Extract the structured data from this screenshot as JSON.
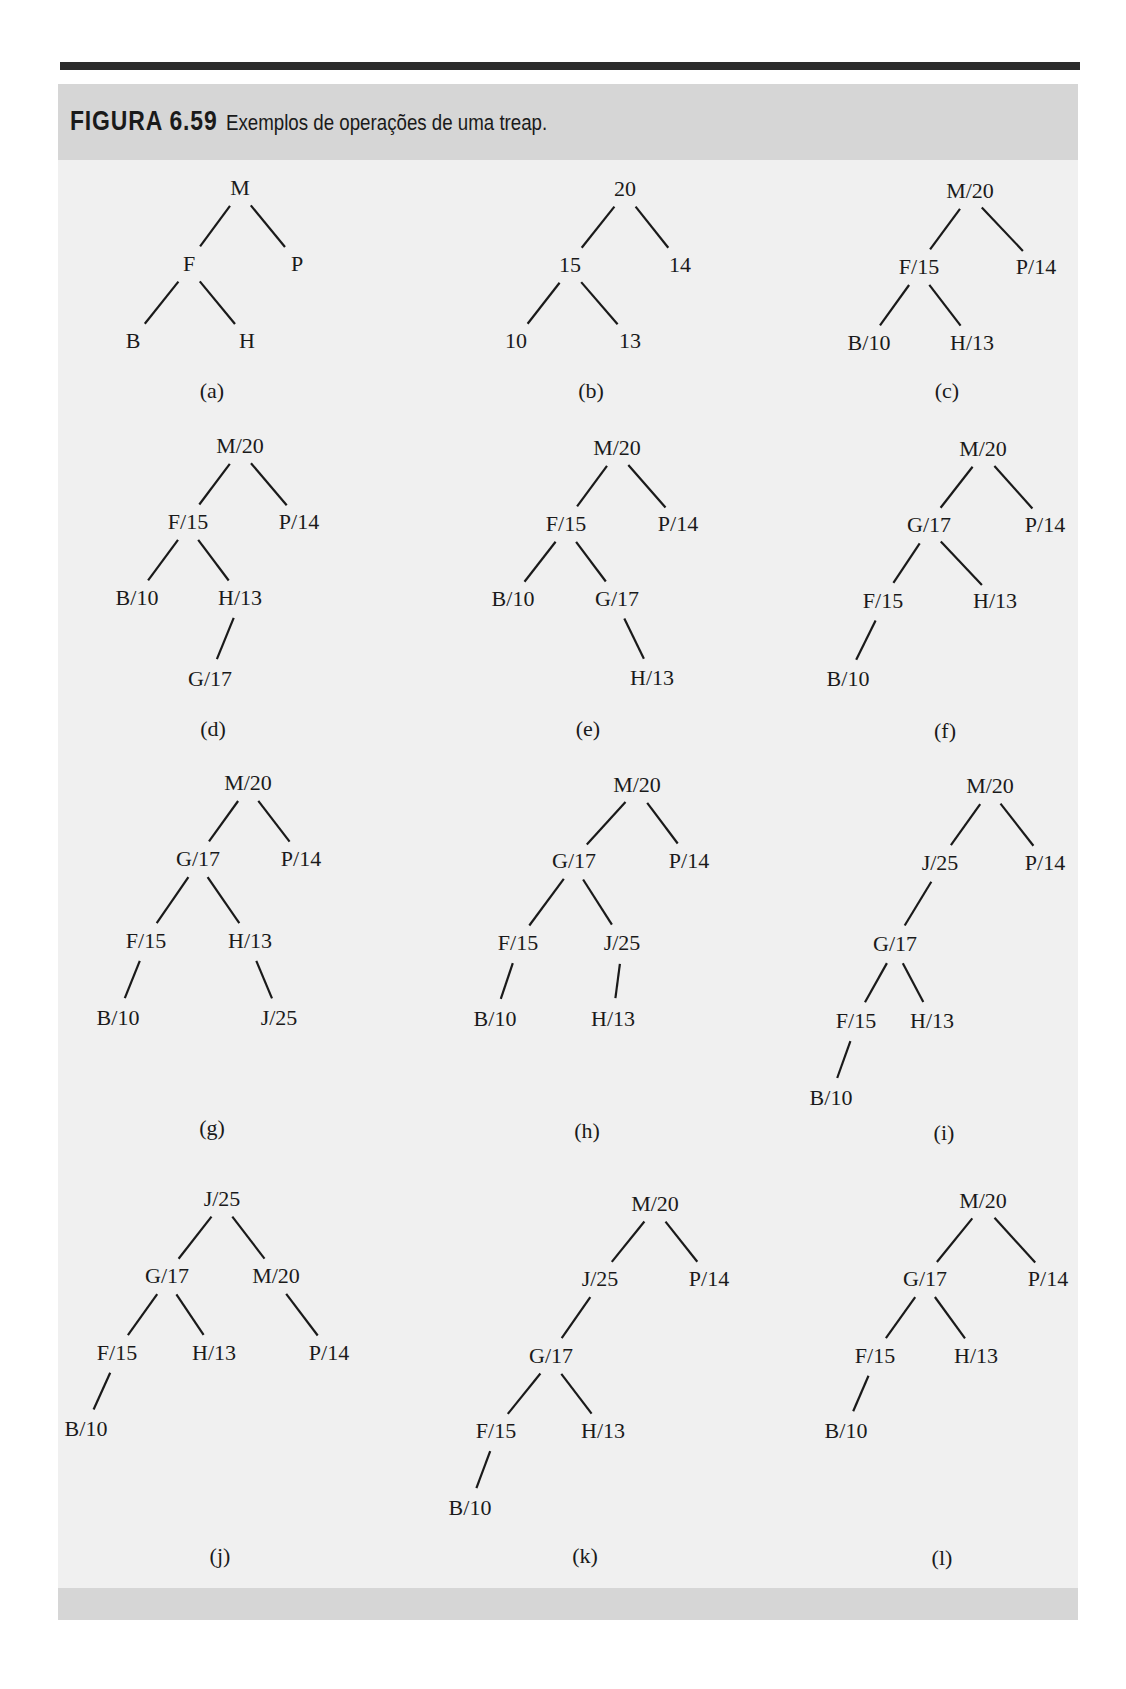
{
  "figure": {
    "number": "FIGURA 6.59",
    "caption": "Exemplos de operações de uma treap."
  },
  "trees": [
    {
      "label": "(a)",
      "label_pos": [
        212,
        390
      ],
      "nodes": [
        {
          "id": "M",
          "text": "M",
          "x": 240,
          "y": 187
        },
        {
          "id": "F",
          "text": "F",
          "x": 189,
          "y": 263
        },
        {
          "id": "P",
          "text": "P",
          "x": 297,
          "y": 263
        },
        {
          "id": "B",
          "text": "B",
          "x": 133,
          "y": 340
        },
        {
          "id": "H",
          "text": "H",
          "x": 247,
          "y": 340
        }
      ],
      "edges": [
        [
          "M",
          "F"
        ],
        [
          "M",
          "P"
        ],
        [
          "F",
          "B"
        ],
        [
          "F",
          "H"
        ]
      ]
    },
    {
      "label": "(b)",
      "label_pos": [
        591,
        390
      ],
      "nodes": [
        {
          "id": "20",
          "text": "20",
          "x": 625,
          "y": 188
        },
        {
          "id": "15",
          "text": "15",
          "x": 570,
          "y": 264
        },
        {
          "id": "14",
          "text": "14",
          "x": 680,
          "y": 264
        },
        {
          "id": "10",
          "text": "10",
          "x": 516,
          "y": 340
        },
        {
          "id": "13",
          "text": "13",
          "x": 630,
          "y": 340
        }
      ],
      "edges": [
        [
          "20",
          "15"
        ],
        [
          "20",
          "14"
        ],
        [
          "15",
          "10"
        ],
        [
          "15",
          "13"
        ]
      ]
    },
    {
      "label": "(c)",
      "label_pos": [
        947,
        390
      ],
      "nodes": [
        {
          "id": "M",
          "text": "M/20",
          "x": 970,
          "y": 190
        },
        {
          "id": "F",
          "text": "F/15",
          "x": 919,
          "y": 266
        },
        {
          "id": "P",
          "text": "P/14",
          "x": 1036,
          "y": 266
        },
        {
          "id": "B",
          "text": "B/10",
          "x": 869,
          "y": 342
        },
        {
          "id": "H",
          "text": "H/13",
          "x": 972,
          "y": 342
        }
      ],
      "edges": [
        [
          "M",
          "F"
        ],
        [
          "M",
          "P"
        ],
        [
          "F",
          "B"
        ],
        [
          "F",
          "H"
        ]
      ]
    },
    {
      "label": "(d)",
      "label_pos": [
        213,
        728
      ],
      "nodes": [
        {
          "id": "M",
          "text": "M/20",
          "x": 240,
          "y": 445
        },
        {
          "id": "F",
          "text": "F/15",
          "x": 188,
          "y": 521
        },
        {
          "id": "P",
          "text": "P/14",
          "x": 299,
          "y": 521
        },
        {
          "id": "B",
          "text": "B/10",
          "x": 137,
          "y": 597
        },
        {
          "id": "H",
          "text": "H/13",
          "x": 240,
          "y": 597
        },
        {
          "id": "G",
          "text": "G/17",
          "x": 210,
          "y": 678
        }
      ],
      "edges": [
        [
          "M",
          "F"
        ],
        [
          "M",
          "P"
        ],
        [
          "F",
          "B"
        ],
        [
          "F",
          "H"
        ],
        [
          "H",
          "G"
        ]
      ]
    },
    {
      "label": "(e)",
      "label_pos": [
        588,
        728
      ],
      "nodes": [
        {
          "id": "M",
          "text": "M/20",
          "x": 617,
          "y": 447
        },
        {
          "id": "F",
          "text": "F/15",
          "x": 566,
          "y": 523
        },
        {
          "id": "P",
          "text": "P/14",
          "x": 678,
          "y": 523
        },
        {
          "id": "B",
          "text": "B/10",
          "x": 513,
          "y": 598
        },
        {
          "id": "G",
          "text": "G/17",
          "x": 617,
          "y": 598
        },
        {
          "id": "H",
          "text": "H/13",
          "x": 652,
          "y": 677
        }
      ],
      "edges": [
        [
          "M",
          "F"
        ],
        [
          "M",
          "P"
        ],
        [
          "F",
          "B"
        ],
        [
          "F",
          "G"
        ],
        [
          "G",
          "H"
        ]
      ]
    },
    {
      "label": "(f)",
      "label_pos": [
        945,
        730
      ],
      "nodes": [
        {
          "id": "M",
          "text": "M/20",
          "x": 983,
          "y": 448
        },
        {
          "id": "G",
          "text": "G/17",
          "x": 929,
          "y": 524
        },
        {
          "id": "P",
          "text": "P/14",
          "x": 1045,
          "y": 524
        },
        {
          "id": "F",
          "text": "F/15",
          "x": 883,
          "y": 600
        },
        {
          "id": "H",
          "text": "H/13",
          "x": 995,
          "y": 600
        },
        {
          "id": "B",
          "text": "B/10",
          "x": 848,
          "y": 678
        }
      ],
      "edges": [
        [
          "M",
          "G"
        ],
        [
          "M",
          "P"
        ],
        [
          "G",
          "F"
        ],
        [
          "G",
          "H"
        ],
        [
          "F",
          "B"
        ]
      ]
    },
    {
      "label": "(g)",
      "label_pos": [
        212,
        1127
      ],
      "nodes": [
        {
          "id": "M",
          "text": "M/20",
          "x": 248,
          "y": 782
        },
        {
          "id": "G",
          "text": "G/17",
          "x": 198,
          "y": 858
        },
        {
          "id": "P",
          "text": "P/14",
          "x": 301,
          "y": 858
        },
        {
          "id": "F",
          "text": "F/15",
          "x": 146,
          "y": 940
        },
        {
          "id": "H",
          "text": "H/13",
          "x": 250,
          "y": 940
        },
        {
          "id": "B",
          "text": "B/10",
          "x": 118,
          "y": 1017
        },
        {
          "id": "J",
          "text": "J/25",
          "x": 279,
          "y": 1017
        }
      ],
      "edges": [
        [
          "M",
          "G"
        ],
        [
          "M",
          "P"
        ],
        [
          "G",
          "F"
        ],
        [
          "G",
          "H"
        ],
        [
          "F",
          "B"
        ],
        [
          "H",
          "J"
        ]
      ]
    },
    {
      "label": "(h)",
      "label_pos": [
        587,
        1130
      ],
      "nodes": [
        {
          "id": "M",
          "text": "M/20",
          "x": 637,
          "y": 784
        },
        {
          "id": "G",
          "text": "G/17",
          "x": 574,
          "y": 860
        },
        {
          "id": "P",
          "text": "P/14",
          "x": 689,
          "y": 860
        },
        {
          "id": "F",
          "text": "F/15",
          "x": 518,
          "y": 942
        },
        {
          "id": "J",
          "text": "J/25",
          "x": 622,
          "y": 942
        },
        {
          "id": "B",
          "text": "B/10",
          "x": 495,
          "y": 1018
        },
        {
          "id": "H",
          "text": "H/13",
          "x": 613,
          "y": 1018
        }
      ],
      "edges": [
        [
          "M",
          "G"
        ],
        [
          "M",
          "P"
        ],
        [
          "G",
          "F"
        ],
        [
          "G",
          "J"
        ],
        [
          "F",
          "B"
        ],
        [
          "J",
          "H"
        ]
      ]
    },
    {
      "label": "(i)",
      "label_pos": [
        944,
        1132
      ],
      "nodes": [
        {
          "id": "M",
          "text": "M/20",
          "x": 990,
          "y": 785
        },
        {
          "id": "J",
          "text": "J/25",
          "x": 940,
          "y": 862
        },
        {
          "id": "P",
          "text": "P/14",
          "x": 1045,
          "y": 862
        },
        {
          "id": "G",
          "text": "G/17",
          "x": 895,
          "y": 943
        },
        {
          "id": "F",
          "text": "F/15",
          "x": 856,
          "y": 1020
        },
        {
          "id": "H",
          "text": "H/13",
          "x": 932,
          "y": 1020
        },
        {
          "id": "B",
          "text": "B/10",
          "x": 831,
          "y": 1097
        }
      ],
      "edges": [
        [
          "M",
          "J"
        ],
        [
          "M",
          "P"
        ],
        [
          "J",
          "G"
        ],
        [
          "G",
          "F"
        ],
        [
          "G",
          "H"
        ],
        [
          "F",
          "B"
        ]
      ]
    },
    {
      "label": "(j)",
      "label_pos": [
        220,
        1555
      ],
      "nodes": [
        {
          "id": "J",
          "text": "J/25",
          "x": 222,
          "y": 1198
        },
        {
          "id": "G",
          "text": "G/17",
          "x": 167,
          "y": 1275
        },
        {
          "id": "M",
          "text": "M/20",
          "x": 276,
          "y": 1275
        },
        {
          "id": "F",
          "text": "F/15",
          "x": 117,
          "y": 1352
        },
        {
          "id": "H",
          "text": "H/13",
          "x": 214,
          "y": 1352
        },
        {
          "id": "P",
          "text": "P/14",
          "x": 329,
          "y": 1352
        },
        {
          "id": "B",
          "text": "B/10",
          "x": 86,
          "y": 1428
        }
      ],
      "edges": [
        [
          "J",
          "G"
        ],
        [
          "J",
          "M"
        ],
        [
          "G",
          "F"
        ],
        [
          "G",
          "H"
        ],
        [
          "M",
          "P"
        ],
        [
          "F",
          "B"
        ]
      ]
    },
    {
      "label": "(k)",
      "label_pos": [
        585,
        1555
      ],
      "nodes": [
        {
          "id": "M",
          "text": "M/20",
          "x": 655,
          "y": 1203
        },
        {
          "id": "J",
          "text": "J/25",
          "x": 600,
          "y": 1278
        },
        {
          "id": "P",
          "text": "P/14",
          "x": 709,
          "y": 1278
        },
        {
          "id": "G",
          "text": "G/17",
          "x": 551,
          "y": 1355
        },
        {
          "id": "F",
          "text": "F/15",
          "x": 496,
          "y": 1430
        },
        {
          "id": "H",
          "text": "H/13",
          "x": 603,
          "y": 1430
        },
        {
          "id": "B",
          "text": "B/10",
          "x": 470,
          "y": 1507
        }
      ],
      "edges": [
        [
          "M",
          "J"
        ],
        [
          "M",
          "P"
        ],
        [
          "J",
          "G"
        ],
        [
          "G",
          "F"
        ],
        [
          "G",
          "H"
        ],
        [
          "F",
          "B"
        ]
      ]
    },
    {
      "label": "(l)",
      "label_pos": [
        942,
        1557
      ],
      "nodes": [
        {
          "id": "M",
          "text": "M/20",
          "x": 983,
          "y": 1200
        },
        {
          "id": "G",
          "text": "G/17",
          "x": 925,
          "y": 1278
        },
        {
          "id": "P",
          "text": "P/14",
          "x": 1048,
          "y": 1278
        },
        {
          "id": "F",
          "text": "F/15",
          "x": 875,
          "y": 1355
        },
        {
          "id": "H",
          "text": "H/13",
          "x": 976,
          "y": 1355
        },
        {
          "id": "B",
          "text": "B/10",
          "x": 846,
          "y": 1430
        }
      ],
      "edges": [
        [
          "M",
          "G"
        ],
        [
          "M",
          "P"
        ],
        [
          "G",
          "F"
        ],
        [
          "G",
          "H"
        ],
        [
          "F",
          "B"
        ]
      ]
    }
  ]
}
